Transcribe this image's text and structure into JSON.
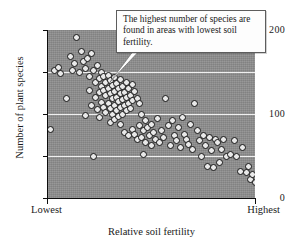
{
  "figure": {
    "callout_text": "The highest number of species are found in areas with lowest soil fertility."
  },
  "chart_data": {
    "type": "scatter",
    "title": "",
    "xlabel": "Relative soil fertility",
    "ylabel": "Number of plant species",
    "x_tick_labels": [
      "Lowest",
      "Highest"
    ],
    "y_tick_labels": [
      "0",
      "100",
      "200"
    ],
    "y_ticks_all": [
      0,
      50,
      100,
      150,
      200
    ],
    "ylim": [
      0,
      200
    ],
    "xlim": [
      0,
      100
    ],
    "grid": "horizontal",
    "gridlines_at": [
      50,
      100,
      150
    ],
    "legend": "none",
    "annotation": "The highest number of species are found in areas with lowest soil fertility.",
    "marker": "open-circle",
    "plot_background_color": "#8e8e8e",
    "gridline_color": "#efefef",
    "marker_fill_color": "#e9e9e9",
    "marker_edge_color": "#141414",
    "points": [
      [
        1,
        82
      ],
      [
        3,
        152
      ],
      [
        5,
        155
      ],
      [
        6,
        148
      ],
      [
        9,
        118
      ],
      [
        11,
        168
      ],
      [
        12,
        152
      ],
      [
        13,
        160
      ],
      [
        14,
        191
      ],
      [
        15,
        150
      ],
      [
        16,
        175
      ],
      [
        17,
        163
      ],
      [
        18,
        154
      ],
      [
        18,
        98
      ],
      [
        19,
        166
      ],
      [
        20,
        145
      ],
      [
        20,
        128
      ],
      [
        21,
        172
      ],
      [
        21,
        110
      ],
      [
        22,
        152
      ],
      [
        22,
        49
      ],
      [
        23,
        137
      ],
      [
        23,
        120
      ],
      [
        24,
        158
      ],
      [
        24,
        105
      ],
      [
        25,
        142
      ],
      [
        25,
        126
      ],
      [
        25,
        96
      ],
      [
        26,
        150
      ],
      [
        26,
        133
      ],
      [
        26,
        114
      ],
      [
        27,
        145
      ],
      [
        27,
        128
      ],
      [
        27,
        108
      ],
      [
        28,
        138
      ],
      [
        28,
        122
      ],
      [
        28,
        102
      ],
      [
        29,
        146
      ],
      [
        29,
        130
      ],
      [
        29,
        112
      ],
      [
        30,
        140
      ],
      [
        30,
        124
      ],
      [
        30,
        106
      ],
      [
        30,
        90
      ],
      [
        31,
        134
      ],
      [
        31,
        118
      ],
      [
        31,
        99
      ],
      [
        32,
        143
      ],
      [
        32,
        127
      ],
      [
        32,
        110
      ],
      [
        32,
        93
      ],
      [
        33,
        136
      ],
      [
        33,
        120
      ],
      [
        33,
        104
      ],
      [
        34,
        130
      ],
      [
        34,
        115
      ],
      [
        34,
        97
      ],
      [
        35,
        141
      ],
      [
        35,
        124
      ],
      [
        35,
        108
      ],
      [
        35,
        88
      ],
      [
        36,
        133
      ],
      [
        36,
        117
      ],
      [
        36,
        100
      ],
      [
        37,
        126
      ],
      [
        37,
        110
      ],
      [
        37,
        78
      ],
      [
        38,
        138
      ],
      [
        38,
        120
      ],
      [
        38,
        104
      ],
      [
        39,
        130
      ],
      [
        39,
        113
      ],
      [
        39,
        74
      ],
      [
        40,
        122
      ],
      [
        40,
        106
      ],
      [
        41,
        135
      ],
      [
        41,
        116
      ],
      [
        41,
        82
      ],
      [
        42,
        127
      ],
      [
        42,
        76
      ],
      [
        43,
        119
      ],
      [
        43,
        70
      ],
      [
        44,
        112
      ],
      [
        44,
        86
      ],
      [
        45,
        100
      ],
      [
        45,
        72
      ],
      [
        46,
        80
      ],
      [
        46,
        52
      ],
      [
        47,
        92
      ],
      [
        47,
        66
      ],
      [
        48,
        84
      ],
      [
        49,
        74
      ],
      [
        50,
        88
      ],
      [
        50,
        62
      ],
      [
        51,
        78
      ],
      [
        52,
        70
      ],
      [
        53,
        95
      ],
      [
        54,
        66
      ],
      [
        55,
        80
      ],
      [
        56,
        72
      ],
      [
        57,
        118
      ],
      [
        58,
        86
      ],
      [
        59,
        62
      ],
      [
        60,
        92
      ],
      [
        61,
        74
      ],
      [
        62,
        68
      ],
      [
        63,
        84
      ],
      [
        64,
        60
      ],
      [
        65,
        96
      ],
      [
        66,
        76
      ],
      [
        67,
        70
      ],
      [
        68,
        64
      ],
      [
        69,
        88
      ],
      [
        70,
        58
      ],
      [
        71,
        112
      ],
      [
        72,
        80
      ],
      [
        73,
        68
      ],
      [
        74,
        50
      ],
      [
        75,
        74
      ],
      [
        76,
        62
      ],
      [
        77,
        38
      ],
      [
        78,
        72
      ],
      [
        79,
        56
      ],
      [
        80,
        36
      ],
      [
        81,
        70
      ],
      [
        82,
        66
      ],
      [
        83,
        42
      ],
      [
        84,
        58
      ],
      [
        85,
        70
      ],
      [
        86,
        50
      ],
      [
        88,
        52
      ],
      [
        90,
        68
      ],
      [
        91,
        50
      ],
      [
        93,
        32
      ],
      [
        94,
        60
      ],
      [
        96,
        30
      ],
      [
        97,
        38
      ],
      [
        98,
        22
      ],
      [
        99,
        28
      ],
      [
        100,
        18
      ]
    ]
  }
}
